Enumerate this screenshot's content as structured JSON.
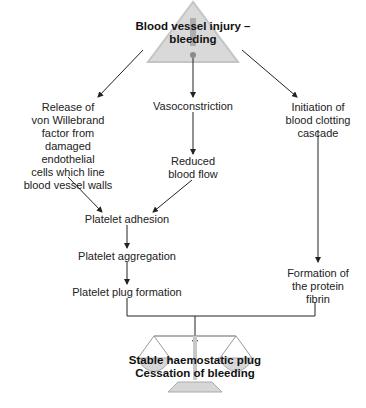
{
  "diagram": {
    "title": "Blood vessel injury –\nbleeding",
    "nodes": {
      "vwf": "Release of\nvon Willebrand\nfactor from\ndamaged\nendothelial\ncells which line\nblood vessel walls",
      "vasoconstriction": "Vasoconstriction",
      "cascade": "Initiation of\nblood clotting\ncascade",
      "reduced_flow": "Reduced\nblood flow",
      "adhesion": "Platelet adhesion",
      "aggregation": "Platelet aggregation",
      "plug_formation": "Platelet plug formation",
      "fibrin": "Formation of\nthe protein\nfibrin",
      "outcome": "Stable haemostatic plug\nCessation of bleeding"
    },
    "icons": {
      "top": "warning-triangle-icon",
      "bottom": "balance-scale-icon"
    },
    "colors": {
      "triangle_fill": "#d9d9d9",
      "triangle_stroke": "#bdbdbd",
      "scale_fill": "#d6d6d6",
      "line": "#333333"
    }
  }
}
